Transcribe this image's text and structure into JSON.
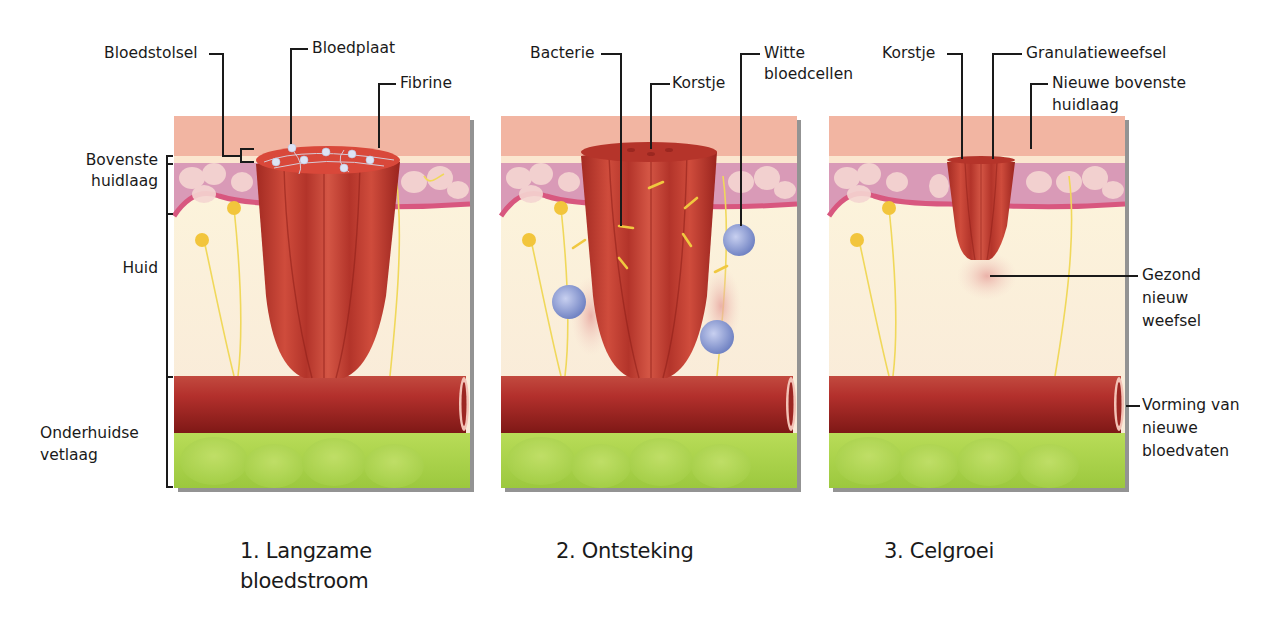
{
  "diagram": {
    "colors": {
      "epidermis": "#f2b5a2",
      "epidermis_line": "#fbe6cf",
      "dermis_top": "#d99ab7",
      "dermis_membrane": "#d8577f",
      "dermis": "#fbf2dc",
      "vessel": "#b3302c",
      "vessel_dark": "#8c1e1c",
      "fat": "#a9d24a",
      "clot": "#c63a2c",
      "white_cell": "#8fa0d8",
      "bacteria": "#f0c840",
      "nerve": "#f3df6a"
    },
    "layer_labels": {
      "top_skin_line1": "Bovenste",
      "top_skin_line2": "huidlaag",
      "skin": "Huid",
      "subcutaneous_line1": "Onderhuidse",
      "subcutaneous_line2": "vetlaag"
    },
    "panels": [
      {
        "caption_line1": "1. Langzame",
        "caption_line2": "bloedstroom",
        "callouts": {
          "blood_clot": "Bloedstolsel",
          "platelet": "Bloedplaat",
          "fibrin": "Fibrine"
        }
      },
      {
        "caption_line1": "2. Ontsteking",
        "callouts": {
          "bacteria": "Bacterie",
          "scab": "Korstje",
          "white_cells_line1": "Witte",
          "white_cells_line2": "bloedcellen"
        }
      },
      {
        "caption_line1": "3. Celgroei",
        "callouts": {
          "scab": "Korstje",
          "granulation": "Granulatieweefsel",
          "new_top_line1": "Nieuwe bovenste",
          "new_top_line2": "huidlaag",
          "healthy_line1": "Gezond",
          "healthy_line2": "nieuw",
          "healthy_line3": "weefsel",
          "vessels_line1": "Vorming van",
          "vessels_line2": "nieuwe",
          "vessels_line3": "bloedvaten"
        }
      }
    ]
  }
}
